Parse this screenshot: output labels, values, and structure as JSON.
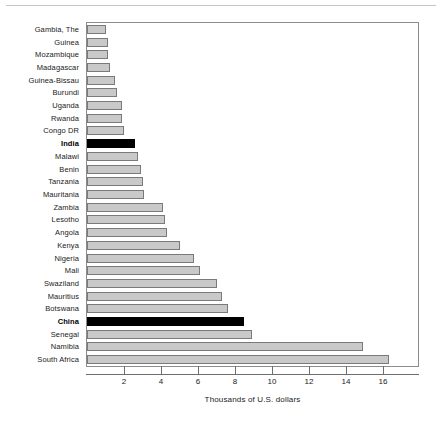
{
  "chart_data": {
    "type": "bar",
    "orientation": "horizontal",
    "title": "",
    "subtitle": "",
    "xlabel": "Thousands of U.S. dollars",
    "ylabel": "",
    "xlim": [
      0,
      17.9
    ],
    "xticks": [
      2,
      4,
      6,
      8,
      10,
      12,
      14,
      16
    ],
    "xtick_labels": [
      "2",
      "4",
      "6",
      "8",
      "10",
      "12",
      "14",
      "16"
    ],
    "grid": false,
    "legend": null,
    "categories": [
      "Gambia, The",
      "Guinea",
      "Mozambique",
      "Madagascar",
      "Guinea-Bissau",
      "Burundi",
      "Uganda",
      "Rwanda",
      "Congo DR",
      "India",
      "Malawi",
      "Benin",
      "Tanzania",
      "Mauritania",
      "Zambia",
      "Lesotho",
      "Angola",
      "Kenya",
      "Nigeria",
      "Mali",
      "Swaziland",
      "Mauritius",
      "Botswana",
      "China",
      "Senegal",
      "Namibia",
      "South Africa"
    ],
    "values": [
      1.0,
      1.15,
      1.15,
      1.25,
      1.5,
      1.6,
      1.9,
      1.9,
      2.0,
      2.6,
      2.75,
      2.9,
      3.0,
      3.1,
      4.1,
      4.2,
      4.3,
      5.0,
      5.8,
      6.1,
      7.0,
      7.3,
      7.6,
      8.5,
      8.9,
      14.9,
      16.3
    ],
    "highlighted": [
      "India",
      "China"
    ],
    "colors": {
      "bar_fill": "#c9c9c9",
      "bar_edge": "#7a7a7a",
      "highlight_fill": "#000000",
      "axis": "#6e6e6e",
      "frame": "#8c8c8c",
      "text": "#1a1a1a"
    }
  }
}
